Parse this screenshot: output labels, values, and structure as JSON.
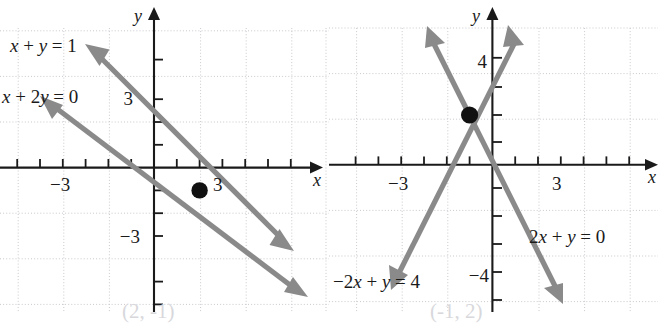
{
  "figure": {
    "title": "",
    "panels": [
      {
        "id": "left",
        "name": "panel-left",
        "axis_x_label": "x",
        "axis_y_label": "y",
        "x_tick_labels": [
          {
            "value": -3,
            "text": "-3"
          },
          {
            "value": 3,
            "text": "3"
          }
        ],
        "y_tick_labels": [
          {
            "value": 3,
            "text": "3"
          },
          {
            "value": -3,
            "text": "-3"
          }
        ],
        "line_labels": [
          {
            "key": "l1",
            "parts": [
              "x",
              " + ",
              "y",
              " = 1"
            ],
            "text": "x + y = 1"
          },
          {
            "key": "l2",
            "parts": [
              "x",
              " + 2",
              "y",
              " = 0"
            ],
            "text": "x + 2y = 0"
          }
        ],
        "intersection_text": "(2, -1)"
      },
      {
        "id": "right",
        "name": "panel-right",
        "axis_x_label": "x",
        "axis_y_label": "y",
        "x_tick_labels": [
          {
            "value": -3,
            "text": "-3"
          },
          {
            "value": 3,
            "text": "3"
          }
        ],
        "y_tick_labels": [
          {
            "value": 4,
            "text": "4"
          },
          {
            "value": -4,
            "text": "-4"
          }
        ],
        "line_labels": [
          {
            "key": "r1",
            "parts": [
              "-2",
              "x",
              " + ",
              "y",
              " = 4"
            ],
            "text": "-2x + y = 4"
          },
          {
            "key": "r2",
            "parts": [
              "2",
              "x",
              " + ",
              "y",
              " = 0"
            ],
            "text": "2x + y = 0"
          }
        ],
        "intersection_text": "(-1, 2)"
      }
    ]
  },
  "chart_data": [
    {
      "type": "line",
      "title": "",
      "xlabel": "x",
      "ylabel": "y",
      "xlim": [
        -7,
        7
      ],
      "ylim": [
        -6.5,
        6
      ],
      "grid": true,
      "grid_step": 2,
      "tick_step": 1,
      "xticks": [
        -3,
        3
      ],
      "yticks": [
        3,
        -3
      ],
      "series": [
        {
          "name": "x + y = 1",
          "equation": "x + y = 1",
          "slope": -1,
          "intercept": 1,
          "points": [
            [
              -2.6,
              3.6
            ],
            [
              5.4,
              -4.4
            ]
          ],
          "color": "#8a8a8a",
          "arrows": "both"
        },
        {
          "name": "x + 2y = 0",
          "equation": "x + 2y = 0",
          "slope": -0.5,
          "intercept": 0,
          "points": [
            [
              -5.2,
              2.6
            ],
            [
              6.4,
              -3.2
            ]
          ],
          "color": "#8a8a8a",
          "arrows": "both"
        }
      ],
      "annotations": [
        {
          "text": "x + y = 1",
          "x": -6.2,
          "y": 4.6
        },
        {
          "text": "x + 2y = 0",
          "x": -6.9,
          "y": 2.6
        }
      ],
      "markers": [
        {
          "x": 2,
          "y": -1,
          "label": "(2, -1)",
          "color": "#111111"
        }
      ]
    },
    {
      "type": "line",
      "title": "",
      "xlabel": "x",
      "ylabel": "y",
      "xlim": [
        -7,
        7
      ],
      "ylim": [
        -6.5,
        6
      ],
      "grid": true,
      "grid_step": 2,
      "tick_step": 1,
      "xticks": [
        -3,
        3
      ],
      "yticks": [
        4,
        -4
      ],
      "series": [
        {
          "name": "-2x + y = 4",
          "equation": "-2x + y = 4",
          "slope": 2,
          "intercept": 4,
          "points": [
            [
              -4.6,
              -5.2
            ],
            [
              0.5,
              5.0
            ]
          ],
          "color": "#8a8a8a",
          "arrows": "both"
        },
        {
          "name": "2x + y = 0",
          "equation": "2x + y = 0",
          "slope": -2,
          "intercept": 0,
          "points": [
            [
              -2.6,
              5.2
            ],
            [
              2.8,
              -5.6
            ]
          ],
          "color": "#8a8a8a",
          "arrows": "both"
        }
      ],
      "annotations": [
        {
          "text": "-2x + y = 4",
          "x": -6.6,
          "y": -4.4
        },
        {
          "text": "2x + y = 0",
          "x": 1.2,
          "y": -2.6
        }
      ],
      "markers": [
        {
          "x": -1,
          "y": 2,
          "label": "(-1, 2)",
          "color": "#111111"
        }
      ]
    }
  ]
}
